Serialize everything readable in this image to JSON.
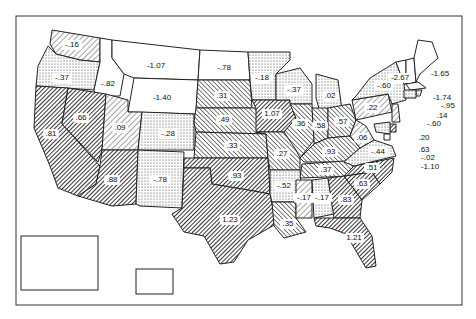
{
  "map": {
    "title": "",
    "patterns": {
      "none": "#ffffff",
      "dots": "dots",
      "light-hatch": "light-hatch",
      "medium-hatch": "medium-hatch",
      "dense-hatch": "dense-hatch"
    },
    "states": [
      {
        "id": "WA",
        "value": "-.16",
        "pattern": "light-hatch"
      },
      {
        "id": "OR",
        "value": "-.37",
        "pattern": "dots"
      },
      {
        "id": "ID",
        "value": "-.82",
        "pattern": "none"
      },
      {
        "id": "MT",
        "value": "-1.07",
        "pattern": "none"
      },
      {
        "id": "WY",
        "value": "-1.40",
        "pattern": "none"
      },
      {
        "id": "CA",
        "value": ".81",
        "pattern": "dense-hatch"
      },
      {
        "id": "NV",
        "value": ".66",
        "pattern": "dense-hatch"
      },
      {
        "id": "UT",
        "value": ".09",
        "pattern": "light-hatch"
      },
      {
        "id": "AZ",
        "value": ".88",
        "pattern": "dense-hatch"
      },
      {
        "id": "CO",
        "value": "-.28",
        "pattern": "dots"
      },
      {
        "id": "NM",
        "value": "-.78",
        "pattern": "dots"
      },
      {
        "id": "ND",
        "value": "-.78",
        "pattern": "none"
      },
      {
        "id": "SD",
        "value": ".31",
        "pattern": "medium-hatch"
      },
      {
        "id": "NE",
        "value": ".49",
        "pattern": "medium-hatch"
      },
      {
        "id": "KS",
        "value": ".33",
        "pattern": "medium-hatch"
      },
      {
        "id": "OK",
        "value": ".93",
        "pattern": "dense-hatch"
      },
      {
        "id": "TX",
        "value": "1.23",
        "pattern": "dense-hatch"
      },
      {
        "id": "MN",
        "value": "-.18",
        "pattern": "dots"
      },
      {
        "id": "IA",
        "value": "1.07",
        "pattern": "dense-hatch"
      },
      {
        "id": "MO",
        "value": ".27",
        "pattern": "medium-hatch"
      },
      {
        "id": "AR",
        "value": "-.52",
        "pattern": "dots"
      },
      {
        "id": "LA",
        "value": ".35",
        "pattern": "medium-hatch"
      },
      {
        "id": "WI",
        "value": "-.37",
        "pattern": "dots"
      },
      {
        "id": "IL",
        "value": ".36",
        "pattern": "medium-hatch"
      },
      {
        "id": "MI",
        "value": ".02",
        "pattern": "dots"
      },
      {
        "id": "IN",
        "value": ".58",
        "pattern": "medium-hatch"
      },
      {
        "id": "OH",
        "value": ".57",
        "pattern": "medium-hatch"
      },
      {
        "id": "KY",
        "value": ".93",
        "pattern": "medium-hatch"
      },
      {
        "id": "TN",
        "value": ".37",
        "pattern": "medium-hatch"
      },
      {
        "id": "MS",
        "value": "-.17",
        "pattern": "light-hatch"
      },
      {
        "id": "AL",
        "value": "-.17",
        "pattern": "dots"
      },
      {
        "id": "GA",
        "value": ".83",
        "pattern": "dense-hatch"
      },
      {
        "id": "FL",
        "value": "1.21",
        "pattern": "dense-hatch"
      },
      {
        "id": "SC",
        "value": ".63",
        "pattern": "dense-hatch"
      },
      {
        "id": "NC",
        "value": ".51",
        "pattern": "dense-hatch"
      },
      {
        "id": "VA",
        "value": "-.44",
        "pattern": "dots"
      },
      {
        "id": "WV",
        "value": ".06",
        "pattern": "light-hatch"
      },
      {
        "id": "PA",
        "value": ".22",
        "pattern": "light-hatch"
      },
      {
        "id": "NY",
        "value": "-.60",
        "pattern": "dots"
      },
      {
        "id": "VT",
        "value": "-2.67",
        "pattern": "none"
      },
      {
        "id": "NH",
        "value": "-1.74",
        "pattern": "none"
      },
      {
        "id": "ME",
        "value": "-1.65",
        "pattern": "none"
      },
      {
        "id": "MA",
        "value": "-.95",
        "pattern": "none"
      },
      {
        "id": "RI",
        "value": ".14",
        "pattern": "dots"
      },
      {
        "id": "CT",
        "value": "-.60",
        "pattern": "dots"
      },
      {
        "id": "NJ",
        "value": ".20",
        "pattern": "light-hatch"
      },
      {
        "id": "DE",
        "value": ".63",
        "pattern": "dense-hatch"
      },
      {
        "id": "MD",
        "value": "-.02",
        "pattern": "dots"
      },
      {
        "id": "DC",
        "value": "-1.10",
        "pattern": "none"
      },
      {
        "id": "AK",
        "value": "-1.74",
        "pattern": "none"
      },
      {
        "id": "HI",
        "value": "3.78",
        "pattern": "none"
      }
    ]
  }
}
